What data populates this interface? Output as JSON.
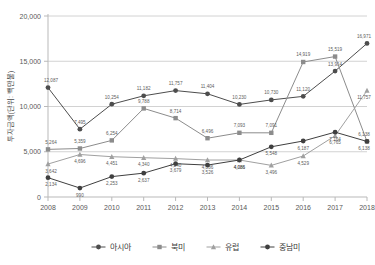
{
  "chart_data": {
    "type": "line",
    "title": "",
    "xlabel": "",
    "ylabel": "투자금액(단위: 백만불)",
    "ylim": [
      0,
      20000
    ],
    "yticks": [
      0,
      5000,
      10000,
      15000,
      20000
    ],
    "ytick_labels": [
      "0",
      "5,000",
      "10,000",
      "15,000",
      "20,000"
    ],
    "grid": true,
    "legend_position": "bottom",
    "categories": [
      "2008",
      "2009",
      "2010",
      "2011",
      "2012",
      "2013",
      "2014",
      "2015",
      "2016",
      "2017",
      "2018"
    ],
    "series": [
      {
        "name": "아시아",
        "color": "#4d4d4d",
        "marker": "circle",
        "values": [
          12087,
          7495,
          10254,
          11182,
          11757,
          11404,
          10230,
          10730,
          11120,
          13914,
          16971
        ],
        "labels": [
          "12,087",
          "7,495",
          "10,254",
          "11,182",
          "11,757",
          "11,404",
          "10,230",
          "10,730",
          "11,120",
          "13,914",
          "16,971"
        ]
      },
      {
        "name": "북미",
        "color": "#8c8c8c",
        "marker": "square",
        "values": [
          5264,
          5359,
          6254,
          9788,
          8714,
          6496,
          7093,
          7091,
          14919,
          15519,
          6138
        ],
        "labels": [
          "5,264",
          "5,359",
          "6,254",
          "9,788",
          "8,714",
          "6,496",
          "7,093",
          "7,091",
          "14,919",
          "15,519",
          "6,138"
        ]
      },
      {
        "name": "유럽",
        "color": "#a0a0a0",
        "marker": "triangle",
        "values": [
          3642,
          4696,
          4451,
          4340,
          4240,
          4086,
          4086,
          3496,
          4529,
          6765,
          11757
        ],
        "labels": [
          "3,642",
          "4,696",
          "4,451",
          "4,340",
          "4,240",
          "4,086",
          "4,086",
          "3,496",
          "4,529",
          "6,765",
          "11,757"
        ]
      },
      {
        "name": "중남미",
        "color": "#3f3f3f",
        "marker": "circle",
        "values": [
          2134,
          990,
          2253,
          2637,
          3679,
          3526,
          4086,
          5548,
          6187,
          7164,
          6138
        ],
        "labels": [
          "2,134",
          "990",
          "2,253",
          "2,637",
          "3,679",
          "3,526",
          "4,086",
          "5,548",
          "6,187",
          "7,164",
          "6,138"
        ]
      }
    ]
  },
  "legend": {
    "items": [
      {
        "label": "아시아",
        "marker": "circle-marker",
        "color": "#4d4d4d"
      },
      {
        "label": "북미",
        "marker": "square-marker",
        "color": "#8c8c8c"
      },
      {
        "label": "유럽",
        "marker": "triangle-marker",
        "color": "#a0a0a0"
      },
      {
        "label": "중남미",
        "marker": "circle-marker",
        "color": "#3f3f3f"
      }
    ]
  }
}
